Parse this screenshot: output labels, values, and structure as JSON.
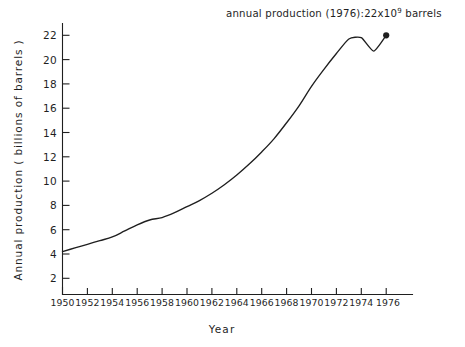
{
  "chart_data": {
    "type": "line",
    "title": "",
    "subtitle": "",
    "xlabel": "Year",
    "ylabel": "Annual production ( billions of barrels )",
    "xlim": [
      1950,
      1977
    ],
    "ylim": [
      0,
      23
    ],
    "grid": false,
    "legend": "none",
    "xticks": [
      "1950",
      "1952",
      "1954",
      "1956",
      "1958",
      "1960",
      "1962",
      "1964",
      "1966",
      "1968",
      "1970",
      "1972",
      "1974",
      "1976"
    ],
    "xtick_values": [
      1950,
      1952,
      1954,
      1956,
      1958,
      1960,
      1962,
      1964,
      1966,
      1968,
      1970,
      1972,
      1974,
      1976
    ],
    "yticks": [
      "2",
      "4",
      "6",
      "8",
      "10",
      "12",
      "14",
      "16",
      "18",
      "20",
      "22"
    ],
    "ytick_values": [
      2,
      4,
      6,
      8,
      10,
      12,
      14,
      16,
      18,
      20,
      22
    ],
    "series": [
      {
        "name": "Annual world oil production",
        "x": [
          1950,
          1951,
          1952,
          1953,
          1954,
          1955,
          1956,
          1957,
          1958,
          1959,
          1960,
          1961,
          1962,
          1963,
          1964,
          1965,
          1966,
          1967,
          1968,
          1969,
          1970,
          1971,
          1972,
          1973,
          1974,
          1975,
          1976
        ],
        "values": [
          4.2,
          4.5,
          4.8,
          5.1,
          5.4,
          5.9,
          6.4,
          6.8,
          7.0,
          7.4,
          7.9,
          8.4,
          9.0,
          9.7,
          10.5,
          11.4,
          12.4,
          13.5,
          14.8,
          16.2,
          17.8,
          19.2,
          20.5,
          21.7,
          21.8,
          20.7,
          22.0
        ]
      }
    ],
    "annotations": [
      {
        "name": "annual-production-1976",
        "text_before": "annual production (1976):22x10",
        "superscript": "9",
        "text_after": " barrels",
        "full_text": "annual production (1976):22x10⁹ barrels",
        "point_year": 1976,
        "point_value": 22
      }
    ],
    "marker": {
      "name": "endpoint-dot",
      "year": 1976,
      "value": 22
    },
    "colors": {
      "line": "#1f1f1f",
      "axis": "#1f1f1f",
      "background": "#ffffff",
      "text": "#1f1f1f"
    }
  }
}
